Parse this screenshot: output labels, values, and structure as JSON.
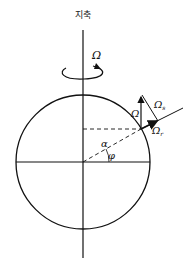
{
  "diagram": {
    "axis_label": "지축",
    "rotation_label": "Ω",
    "vector_labels": {
      "omega": "Ω",
      "omega_s": "Ω",
      "omega_s_sub": "s",
      "omega_r": "Ω",
      "omega_r_sub": "r"
    },
    "angle_labels": {
      "alpha": "α",
      "phi": "φ"
    },
    "geometry": {
      "circle_center": [
        83,
        162
      ],
      "circle_radius": 67,
      "latitude_deg": 30
    },
    "colors": {
      "line": "#111111",
      "background": "#ffffff"
    }
  }
}
